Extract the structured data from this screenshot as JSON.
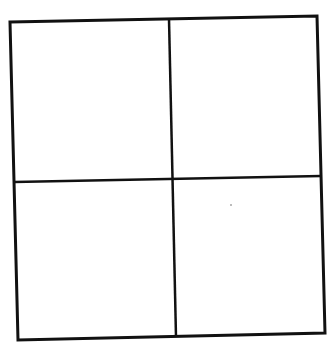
{
  "diagram": {
    "type": "grid",
    "rows": 2,
    "columns": 2,
    "stroke_color": "#111111",
    "background": "#ffffff",
    "cells": [
      {
        "row": 0,
        "col": 0,
        "label": ""
      },
      {
        "row": 0,
        "col": 1,
        "label": ""
      },
      {
        "row": 1,
        "col": 0,
        "label": ""
      },
      {
        "row": 1,
        "col": 1,
        "label": ""
      }
    ]
  }
}
